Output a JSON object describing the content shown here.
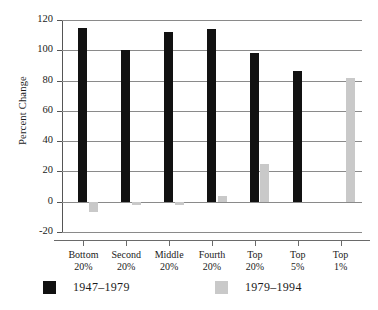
{
  "chart_data": {
    "type": "bar",
    "title": "",
    "xlabel": "",
    "ylabel": "Percent Change",
    "ylim": [
      -20,
      120
    ],
    "yticks": [
      -20,
      0,
      20,
      40,
      60,
      80,
      100,
      120
    ],
    "ytick_labels": [
      "-20",
      "0",
      "20",
      "40",
      "60",
      "80",
      "100",
      "120"
    ],
    "grid": true,
    "legend_position": "bottom",
    "categories": [
      "Bottom 20%",
      "Second 20%",
      "Middle 20%",
      "Fourth 20%",
      "Top 20%",
      "Top 5%",
      "Top 1%"
    ],
    "category_lines": [
      [
        "Bottom",
        "20%"
      ],
      [
        "Second",
        "20%"
      ],
      [
        "Middle",
        "20%"
      ],
      [
        "Fourth",
        "20%"
      ],
      [
        "Top",
        "20%"
      ],
      [
        "Top",
        "5%"
      ],
      [
        "Top",
        "1%"
      ]
    ],
    "series": [
      {
        "name": "1947-1979",
        "color": "#111111",
        "values": [
          115,
          100,
          112,
          114,
          98,
          86,
          null
        ]
      },
      {
        "name": "1979-1994",
        "color": "#c9c9c9",
        "values": [
          -7,
          -2,
          -2,
          4,
          25,
          null,
          82
        ]
      }
    ]
  },
  "legend": {
    "items": [
      {
        "label": "1947–1979",
        "swatch": "black"
      },
      {
        "label": "1979–1994",
        "swatch": "grey"
      }
    ]
  },
  "axes": {
    "y_title": "Percent Change"
  },
  "colors": {
    "series_1": "#111111",
    "series_2": "#c9c9c9",
    "grid": "#8a8a8a",
    "axis": "#555555",
    "text": "#1a1a1a",
    "background": "#ffffff"
  }
}
